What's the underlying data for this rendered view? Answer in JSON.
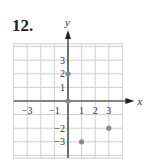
{
  "problem": {
    "number": "12."
  },
  "chart_data": {
    "type": "scatter",
    "title": "",
    "xlabel": "x",
    "ylabel": "y",
    "xlim": [
      -4,
      4
    ],
    "ylim": [
      -4,
      4
    ],
    "grid": true,
    "x_tick_labels": [
      "-3",
      "-1",
      "1",
      "2",
      "3"
    ],
    "y_tick_labels": [
      "3",
      "2",
      "1",
      "-2",
      "-3"
    ],
    "points": [
      {
        "x": 0,
        "y": 2
      },
      {
        "x": 0,
        "y": 0
      },
      {
        "x": 1,
        "y": -3
      },
      {
        "x": 3,
        "y": -2
      }
    ],
    "colors": {
      "grid": "#cfcfcf",
      "axis": "#222222",
      "point": "#8a8a8a"
    }
  }
}
